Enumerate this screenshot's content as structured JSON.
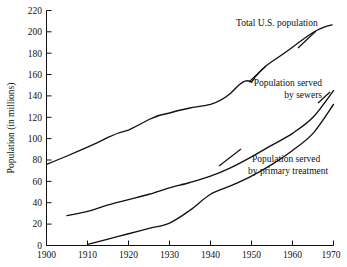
{
  "chart_data": {
    "type": "line",
    "title": "",
    "subtitle": "",
    "xlabel": "",
    "ylabel": "Population (in millions)",
    "xlim": [
      1900,
      1970
    ],
    "ylim": [
      0,
      220
    ],
    "xticks": [
      1900,
      1910,
      1920,
      1930,
      1940,
      1950,
      1960,
      1970
    ],
    "yticks": [
      0,
      20,
      40,
      60,
      80,
      100,
      120,
      140,
      160,
      180,
      200,
      220
    ],
    "xtick_labels": [
      "1900",
      "1910",
      "1920",
      "1930",
      "1940",
      "1950",
      "1960",
      "1970"
    ],
    "ytick_labels": [
      "0",
      "20",
      "40",
      "60",
      "80",
      "100",
      "120",
      "140",
      "160",
      "180",
      "200",
      "220"
    ],
    "grid": false,
    "legend_position": "inline-annotations",
    "line_color": "#111111",
    "background_color": "#ffffff",
    "series": [
      {
        "name": "Total U.S. population",
        "x": [
          1900,
          1905,
          1910,
          1915,
          1920,
          1925,
          1930,
          1935,
          1940,
          1945,
          1950,
          1955,
          1960,
          1965,
          1970
        ],
        "values": [
          76,
          84,
          92,
          100,
          106,
          115,
          123,
          128,
          132,
          140,
          152,
          166,
          180,
          194,
          207
        ]
      },
      {
        "name": "Population served by sewers",
        "x": [
          1905,
          1910,
          1915,
          1920,
          1925,
          1930,
          1935,
          1940,
          1945,
          1950,
          1955,
          1960,
          1965,
          1970
        ],
        "values": [
          28,
          32,
          38,
          43,
          48,
          54,
          59,
          65,
          73,
          83,
          94,
          105,
          120,
          145
        ]
      },
      {
        "name": "Population served by primary treatment",
        "x": [
          1910,
          1915,
          1920,
          1925,
          1930,
          1935,
          1940,
          1945,
          1950,
          1955,
          1960,
          1965,
          1970
        ],
        "values": [
          1,
          6,
          11,
          16,
          21,
          33,
          48,
          56,
          65,
          76,
          89,
          105,
          132
        ]
      }
    ],
    "annotations": [
      {
        "text_line1": "Total U.S. population",
        "text_line2": "",
        "align": "left"
      },
      {
        "text_line1": "Population served",
        "text_line2": "by sewers",
        "align": "right"
      },
      {
        "text_line1": "Population served",
        "text_line2": "by primary treatment",
        "align": "center"
      }
    ]
  },
  "axes": {
    "y_axis_title": "Population (in millions)"
  },
  "labels": {
    "total_us_population": "Total U.S. population",
    "sewers_line1": "Population served",
    "sewers_line2": "by sewers",
    "primary_line1": "Population served",
    "primary_line2": "by primary treatment"
  },
  "yticks": {
    "t0": "0",
    "t1": "20",
    "t2": "40",
    "t3": "60",
    "t4": "80",
    "t5": "100",
    "t6": "120",
    "t7": "140",
    "t8": "160",
    "t9": "180",
    "t10": "200",
    "t11": "220"
  },
  "xticks": {
    "t0": "1900",
    "t1": "1910",
    "t2": "1920",
    "t3": "1930",
    "t4": "1940",
    "t5": "1950",
    "t6": "1960",
    "t7": "1970"
  }
}
